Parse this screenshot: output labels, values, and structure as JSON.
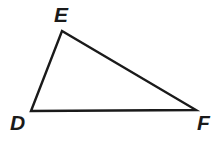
{
  "figure": {
    "type": "geometry-diagram",
    "shape": "triangle",
    "name": "Triangle DEF",
    "background_color": "#ffffff",
    "stroke_color": "#1a1a1a",
    "stroke_width": 2.4,
    "label_color": "#1a1a1a",
    "canvas": {
      "width": 212,
      "height": 151
    },
    "vertices": [
      {
        "id": "D",
        "label": "D",
        "x": 31,
        "y": 111,
        "label_x": 10,
        "label_y": 112,
        "label_position": "below-left"
      },
      {
        "id": "E",
        "label": "E",
        "x": 62,
        "y": 31,
        "label_x": 54,
        "label_y": 4,
        "label_position": "above"
      },
      {
        "id": "F",
        "label": "F",
        "x": 196,
        "y": 110,
        "label_x": 197,
        "label_y": 112,
        "label_position": "below-right"
      }
    ],
    "edges": [
      {
        "id": "DE",
        "from": "D",
        "to": "E",
        "label": ""
      },
      {
        "id": "EF",
        "from": "E",
        "to": "F",
        "label": ""
      },
      {
        "id": "FD",
        "from": "F",
        "to": "D",
        "label": ""
      }
    ],
    "path": "M 31 111 L 62 31 L 196 110 Z"
  }
}
